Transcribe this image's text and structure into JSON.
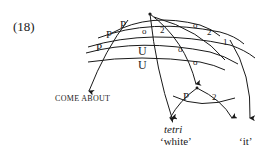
{
  "example_number": "(18)",
  "diagram": {
    "arc_labels_left": [
      "P",
      "P",
      "P"
    ],
    "arc_labels_under_node": [
      "U",
      "U"
    ],
    "arc_labels_right": [
      {
        "label": "o",
        "value": "2"
      },
      {
        "label": "o",
        "value": "2"
      },
      {
        "label": "o",
        "value": "1"
      }
    ],
    "inner_arc_labels": [
      "o",
      "2",
      "o"
    ],
    "sub_node_labels": {
      "left": "P",
      "right": "2"
    }
  },
  "terminals": {
    "come_about": "COME ABOUT",
    "tetri": "tetri",
    "white": "‘white’",
    "it": "‘it’"
  }
}
